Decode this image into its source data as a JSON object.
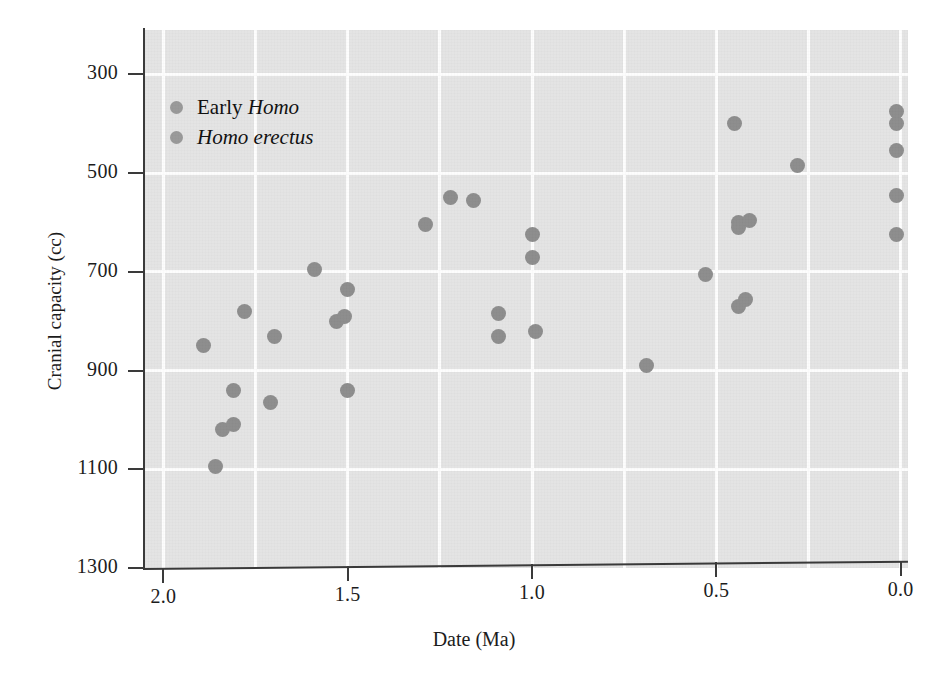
{
  "figure": {
    "background_color": "#ffffff",
    "plot_background_color": "#e4e4e4",
    "gridline_color": "#fdfdfd",
    "marker_color": "#8e8e8e",
    "axis_color": "#3a3a3a"
  },
  "axes": {
    "x_title": "Date (Ma)",
    "y_title": "Cranial capacity (cc)",
    "x_ticks": [
      "2.0",
      "1.5",
      "1.0",
      "0.5",
      "0.0"
    ],
    "y_ticks": [
      "1300",
      "1100",
      "900",
      "700",
      "500",
      "300"
    ]
  },
  "legend": {
    "items": [
      {
        "label_plain": "Early ",
        "label_italic": "Homo",
        "marker_color": "#9a9a9a"
      },
      {
        "label_plain": "",
        "label_italic": "Homo erectus",
        "marker_color": "#9a9a9a"
      }
    ]
  },
  "chart_data": {
    "type": "scatter",
    "title": "",
    "xlabel": "Date (Ma)",
    "ylabel": "Cranial capacity (cc)",
    "xlim": [
      2.05,
      -0.02
    ],
    "ylim": [
      300,
      1390
    ],
    "x_reversed": true,
    "grid": true,
    "legend_position": "upper-left-inside",
    "xticks": [
      2.0,
      1.5,
      1.0,
      0.5,
      0.0
    ],
    "yticks": [
      300,
      500,
      700,
      900,
      1100,
      1300
    ],
    "series": [
      {
        "name": "Early Homo",
        "color": "#8e8e8e",
        "points": [
          {
            "x": 1.89,
            "y": 750
          },
          {
            "x": 1.86,
            "y": 505
          },
          {
            "x": 1.84,
            "y": 580
          },
          {
            "x": 1.81,
            "y": 590
          },
          {
            "x": 1.81,
            "y": 660
          },
          {
            "x": 1.78,
            "y": 820
          },
          {
            "x": 1.71,
            "y": 635
          },
          {
            "x": 1.7,
            "y": 770
          }
        ]
      },
      {
        "name": "Homo erectus",
        "color": "#8e8e8e",
        "points": [
          {
            "x": 1.59,
            "y": 905
          },
          {
            "x": 1.53,
            "y": 800
          },
          {
            "x": 1.51,
            "y": 810
          },
          {
            "x": 1.5,
            "y": 865
          },
          {
            "x": 1.5,
            "y": 660
          },
          {
            "x": 1.29,
            "y": 995
          },
          {
            "x": 1.22,
            "y": 1050
          },
          {
            "x": 1.16,
            "y": 1045
          },
          {
            "x": 1.09,
            "y": 815
          },
          {
            "x": 1.09,
            "y": 770
          },
          {
            "x": 1.0,
            "y": 975
          },
          {
            "x": 1.0,
            "y": 930
          },
          {
            "x": 0.99,
            "y": 780
          },
          {
            "x": 0.69,
            "y": 710
          },
          {
            "x": 0.53,
            "y": 895
          },
          {
            "x": 0.45,
            "y": 1200
          },
          {
            "x": 0.44,
            "y": 1000
          },
          {
            "x": 0.44,
            "y": 990
          },
          {
            "x": 0.44,
            "y": 830
          },
          {
            "x": 0.42,
            "y": 845
          },
          {
            "x": 0.41,
            "y": 1005
          },
          {
            "x": 0.28,
            "y": 1115
          },
          {
            "x": 0.01,
            "y": 1225
          },
          {
            "x": 0.01,
            "y": 1200
          },
          {
            "x": 0.01,
            "y": 1145
          },
          {
            "x": 0.01,
            "y": 1055
          },
          {
            "x": 0.01,
            "y": 975
          }
        ]
      }
    ]
  }
}
